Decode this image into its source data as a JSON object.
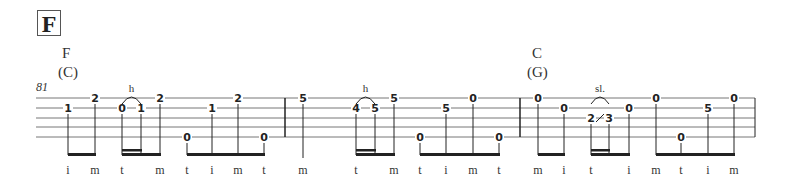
{
  "section": {
    "label": "F"
  },
  "chords": [
    {
      "name": "F",
      "capo": "(C)",
      "x": 62
    },
    {
      "name": "C",
      "capo": "(G)",
      "x": 532
    }
  ],
  "measure_number": "81",
  "staff": {
    "left": 36,
    "right": 755,
    "lines_y": [
      98,
      108,
      118,
      127,
      137
    ],
    "barlines_x": [
      285,
      520,
      755
    ]
  },
  "notes": [
    {
      "x": 68,
      "string": 2,
      "fret": "1",
      "finger": "i"
    },
    {
      "x": 95,
      "string": 1,
      "fret": "2",
      "finger": "m"
    },
    {
      "x": 122,
      "string": 2,
      "fret": "0",
      "finger": "t"
    },
    {
      "x": 141,
      "string": 2,
      "fret": "1",
      "finger": ""
    },
    {
      "x": 160,
      "string": 1,
      "fret": "2",
      "finger": "m"
    },
    {
      "x": 187,
      "string": 5,
      "fret": "0",
      "finger": "t"
    },
    {
      "x": 212,
      "string": 2,
      "fret": "1",
      "finger": "i"
    },
    {
      "x": 238,
      "string": 1,
      "fret": "2",
      "finger": "m"
    },
    {
      "x": 264,
      "string": 5,
      "fret": "0",
      "finger": "t"
    },
    {
      "x": 303,
      "string": 1,
      "fret": "5",
      "finger": "m"
    },
    {
      "x": 356,
      "string": 2,
      "fret": "4",
      "finger": "t"
    },
    {
      "x": 375,
      "string": 2,
      "fret": "5",
      "finger": ""
    },
    {
      "x": 394,
      "string": 1,
      "fret": "5",
      "finger": "m"
    },
    {
      "x": 420,
      "string": 5,
      "fret": "0",
      "finger": "t"
    },
    {
      "x": 446,
      "string": 2,
      "fret": "5",
      "finger": "i"
    },
    {
      "x": 473,
      "string": 1,
      "fret": "0",
      "finger": "m"
    },
    {
      "x": 499,
      "string": 5,
      "fret": "0",
      "finger": "t"
    },
    {
      "x": 538,
      "string": 1,
      "fret": "0",
      "finger": "m"
    },
    {
      "x": 564,
      "string": 2,
      "fret": "0",
      "finger": "i"
    },
    {
      "x": 591,
      "string": 3,
      "fret": "2",
      "finger": "t"
    },
    {
      "x": 609,
      "string": 3,
      "fret": "3",
      "finger": ""
    },
    {
      "x": 629,
      "string": 2,
      "fret": "0",
      "finger": "i"
    },
    {
      "x": 656,
      "string": 1,
      "fret": "0",
      "finger": "m"
    },
    {
      "x": 681,
      "string": 5,
      "fret": "0",
      "finger": "t"
    },
    {
      "x": 708,
      "string": 2,
      "fret": "5",
      "finger": "i"
    },
    {
      "x": 734,
      "string": 1,
      "fret": "0",
      "finger": "m"
    }
  ],
  "techniques": [
    {
      "label": "h",
      "x1": 122,
      "x2": 141,
      "y": 92
    },
    {
      "label": "h",
      "x1": 356,
      "x2": 375,
      "y": 92
    },
    {
      "label": "sl.",
      "x1": 591,
      "x2": 609,
      "y": 92
    }
  ],
  "beams": [
    {
      "x1": 68,
      "x2": 95,
      "sub": null
    },
    {
      "x1": 122,
      "x2": 160,
      "sub": [
        122,
        141
      ]
    },
    {
      "x1": 187,
      "x2": 264,
      "sub": null
    },
    {
      "x1": 356,
      "x2": 394,
      "sub": [
        356,
        375
      ]
    },
    {
      "x1": 420,
      "x2": 499,
      "sub": null
    },
    {
      "x1": 538,
      "x2": 564,
      "sub": null
    },
    {
      "x1": 591,
      "x2": 629,
      "sub": [
        591,
        609
      ]
    },
    {
      "x1": 656,
      "x2": 734,
      "sub": null
    }
  ],
  "colors": {
    "ink": "#222222",
    "staff": "#777777"
  }
}
